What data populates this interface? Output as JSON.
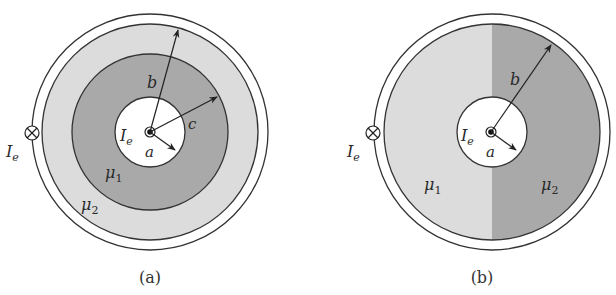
{
  "colors": {
    "background": "#ffffff",
    "light_fill": "#dcdcdc",
    "dark_fill": "#a9a9a9",
    "stroke": "#333333"
  },
  "figure_a": {
    "caption": "(a)",
    "external_current_label": "I",
    "external_current_sub": "e",
    "internal_current_label": "I",
    "internal_current_sub": "e",
    "radius_a_label": "a",
    "radius_b_label": "b",
    "radius_c_label": "c",
    "mu1_label": "μ",
    "mu1_sub": "1",
    "mu2_label": "μ",
    "mu2_sub": "2",
    "external_current_symbol": "into-page (⊗)",
    "internal_current_symbol": "out-of-page (⊙)"
  },
  "figure_b": {
    "caption": "(b)",
    "external_current_label": "I",
    "external_current_sub": "e",
    "internal_current_label": "I",
    "internal_current_sub": "e",
    "radius_a_label": "a",
    "radius_b_label": "b",
    "mu1_label": "μ",
    "mu1_sub": "1",
    "mu2_label": "μ",
    "mu2_sub": "2",
    "external_current_symbol": "into-page (⊗)",
    "internal_current_symbol": "out-of-page (⊙)"
  }
}
